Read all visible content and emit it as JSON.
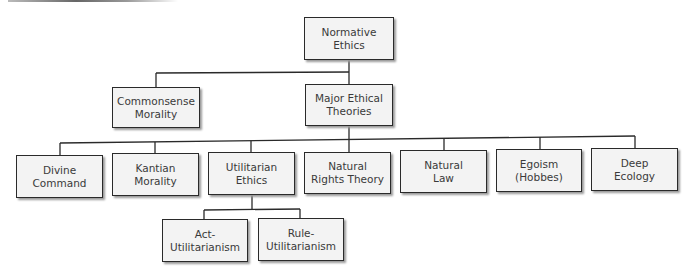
{
  "diagram": {
    "type": "hierarchy-tree",
    "nodes": [
      {
        "id": "normative",
        "label": "Normative\nEthics",
        "parent": null
      },
      {
        "id": "commonsense",
        "label": "Commonsense\nMorality",
        "parent": "normative"
      },
      {
        "id": "major",
        "label": "Major Ethical\nTheories",
        "parent": "normative"
      },
      {
        "id": "divine",
        "label": "Divine\nCommand",
        "parent": "major"
      },
      {
        "id": "kantian",
        "label": "Kantian\nMorality",
        "parent": "major"
      },
      {
        "id": "utilitarian",
        "label": "Utilitarian\nEthics",
        "parent": "major"
      },
      {
        "id": "naturalrights",
        "label": "Natural\nRights Theory",
        "parent": "major"
      },
      {
        "id": "naturallaw",
        "label": "Natural\nLaw",
        "parent": "major"
      },
      {
        "id": "egoism",
        "label": "Egoism\n(Hobbes)",
        "parent": "major"
      },
      {
        "id": "deepecology",
        "label": "Deep\nEcology",
        "parent": "major"
      },
      {
        "id": "act",
        "label": "Act-\nUtilitarianism",
        "parent": "utilitarian"
      },
      {
        "id": "rule",
        "label": "Rule-\nUtilitarianism",
        "parent": "utilitarian"
      }
    ]
  },
  "labels": {
    "normative": "Normative\nEthics",
    "commonsense": "Commonsense\nMorality",
    "major": "Major Ethical\nTheories",
    "divine": "Divine\nCommand",
    "kantian": "Kantian\nMorality",
    "utilitarian": "Utilitarian\nEthics",
    "naturalrights": "Natural\nRights Theory",
    "naturallaw": "Natural\nLaw",
    "egoism": "Egoism\n(Hobbes)",
    "deepecology": "Deep\nEcology",
    "act": "Act-\nUtilitarianism",
    "rule": "Rule-\nUtilitarianism"
  },
  "colors": {
    "box_fill": "#f3f3f3",
    "box_border": "#2a2a2a",
    "line": "#2a2a2a",
    "text": "#3a3a3a"
  }
}
